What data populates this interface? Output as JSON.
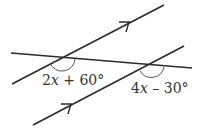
{
  "diagram": {
    "type": "parallel-lines-transversal",
    "colors": {
      "line": "#2b2b2b",
      "arc": "#555555",
      "text": "#333333",
      "background": "#ffffff"
    },
    "lines": {
      "upper_parallel": {
        "x1": 12,
        "y1": 84,
        "x2": 164,
        "y2": 5,
        "arrow_at": [
          128,
          23
        ]
      },
      "lower_parallel": {
        "x1": 33,
        "y1": 125,
        "x2": 184,
        "y2": 46,
        "arrow_at": [
          70,
          106
        ]
      },
      "transversal": {
        "x1": 11,
        "y1": 53,
        "x2": 192,
        "y2": 68
      }
    },
    "angles": [
      {
        "id": "angle1",
        "label_coef": "2",
        "label_var": "x",
        "label_rest": " + 60°",
        "full_label": "2x + 60°",
        "vertex": [
          61,
          57
        ]
      },
      {
        "id": "angle2",
        "label_coef": "4",
        "label_var": "x",
        "label_rest": " – 30°",
        "full_label": "4x – 30°",
        "vertex": [
          151,
          65
        ]
      }
    ]
  }
}
